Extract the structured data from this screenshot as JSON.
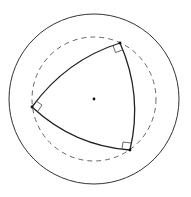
{
  "diagram": {
    "colors": {
      "stroke": "#222222",
      "dashed": "#555555",
      "background": "#ffffff"
    },
    "outer_circle": {
      "cx": 94,
      "cy": 99,
      "r": 85
    },
    "dashed_circle": {
      "cx": 94,
      "cy": 99,
      "r": 62
    },
    "center_point": {
      "cx": 94,
      "cy": 99
    },
    "vertices": [
      {
        "name": "top",
        "x": 120,
        "y": 43
      },
      {
        "name": "left",
        "x": 32,
        "y": 107
      },
      {
        "name": "bottom-right",
        "x": 130,
        "y": 150
      }
    ],
    "right_angle_markers": 3
  }
}
